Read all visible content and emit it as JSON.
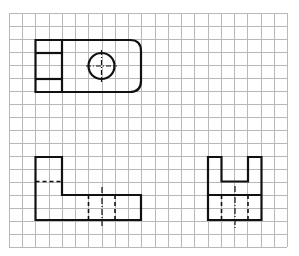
{
  "diagram": {
    "type": "orthographic-projection-on-grid",
    "grid": {
      "x0": 9,
      "y0": 13,
      "cols": 21,
      "rows": 18,
      "cell_w": 13.24,
      "cell_h": 13,
      "color": "#b8b8b8"
    },
    "stroke_color": "#111111",
    "views": [
      {
        "name": "top-view",
        "description": "Rectangle with rounded right end, two horizontal divisions on left section, circular hole with centerlines"
      },
      {
        "name": "front-view",
        "description": "L-shaped profile with hidden horizontal line and hidden hole lines with centerline"
      },
      {
        "name": "side-view",
        "description": "U-shaped profile with slot, horizontal edge, hidden hole lines with centerline"
      }
    ]
  }
}
